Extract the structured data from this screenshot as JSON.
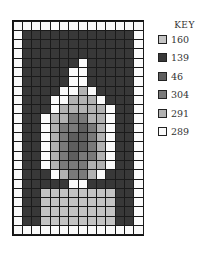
{
  "chart_data": {
    "type": "heatmap",
    "title": "",
    "columns": 14,
    "rows": 23,
    "legend_title": "KEY",
    "legend": [
      {
        "code": "A",
        "label": "160",
        "color": "#c4c4c4"
      },
      {
        "code": "D",
        "label": "139",
        "color": "#383838"
      },
      {
        "code": "K",
        "label": "46",
        "color": "#5e5e5e"
      },
      {
        "code": "M",
        "label": "304",
        "color": "#7a7a7a"
      },
      {
        "code": "L",
        "label": "291",
        "color": "#b2b2b2"
      },
      {
        "code": "W",
        "label": "289",
        "color": "#fafafa"
      }
    ],
    "grid": [
      "WWWWWWWWWWWWWW",
      "WDDDDDDDDDDDDW",
      "WDDDDDDDDDDDDW",
      "WDDDDDDDDDDDDW",
      "WDDDDDDWDDDDDW",
      "WDDDDDWWDDDDDW",
      "WDDDDDWWDDDDDW",
      "WDDDDWWLWDDDDW",
      "WDDDWWLLLWDDDW",
      "WDDDWLLLLLWDDW",
      "WDDWLLMMLLWDDW",
      "WDDWLMMKMLWDDW",
      "WDDWLMKKMLWDDW",
      "WDDWLMKKMLWDDW",
      "WDDWLMKMMLWDDW",
      "WDDWLMMMLLWDDW",
      "WDDDWLMMLWDDDW",
      "WDDDDDWWDDDDDW",
      "WDDAAAAAAAADDW",
      "WDDAAAAAAAADDW",
      "WDDAAAAAAAADDW",
      "WDDAAAAAAAADDW",
      "WWWWWWWWWWWWWW"
    ]
  }
}
